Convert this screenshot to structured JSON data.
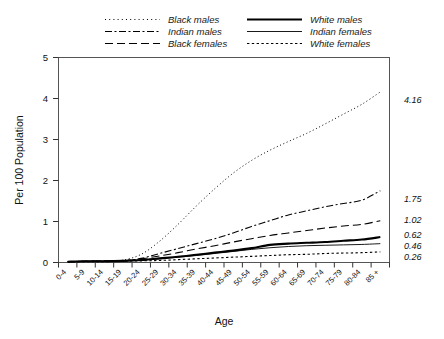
{
  "chart_data": {
    "type": "line",
    "title": "",
    "xlabel": "Age",
    "ylabel": "Per 100 Population",
    "ylim": [
      0,
      5
    ],
    "yticks": [
      "0",
      "1",
      "2",
      "3",
      "4",
      "5"
    ],
    "grid": false,
    "legend_position": "top",
    "categories": [
      "0-4",
      "5-9",
      "10-14",
      "15-19",
      "20-24",
      "25-29",
      "30-34",
      "35-39",
      "40-44",
      "45-49",
      "50-54",
      "55-59",
      "60-64",
      "65-69",
      "70-74",
      "75-79",
      "80-84",
      "85 +"
    ],
    "series": [
      {
        "name": "Black males",
        "style": "dotted",
        "end_value": "4.16",
        "values": [
          0.02,
          0.03,
          0.04,
          0.06,
          0.2,
          0.52,
          0.93,
          1.38,
          1.8,
          2.18,
          2.49,
          2.74,
          2.95,
          3.15,
          3.38,
          3.62,
          3.86,
          4.16
        ]
      },
      {
        "name": "Indian males",
        "style": "dash-dot",
        "end_value": "1.75",
        "values": [
          0.02,
          0.03,
          0.03,
          0.04,
          0.1,
          0.22,
          0.34,
          0.46,
          0.58,
          0.72,
          0.88,
          1.02,
          1.16,
          1.26,
          1.36,
          1.44,
          1.52,
          1.75
        ]
      },
      {
        "name": "Black females",
        "style": "long-dash",
        "end_value": "1.02",
        "values": [
          0.02,
          0.03,
          0.04,
          0.05,
          0.09,
          0.16,
          0.24,
          0.33,
          0.41,
          0.5,
          0.58,
          0.66,
          0.72,
          0.78,
          0.84,
          0.89,
          0.93,
          1.02
        ]
      },
      {
        "name": "White males",
        "style": "solid-thick",
        "end_value": "0.62",
        "values": [
          0.02,
          0.03,
          0.03,
          0.04,
          0.06,
          0.1,
          0.14,
          0.19,
          0.24,
          0.29,
          0.35,
          0.43,
          0.46,
          0.48,
          0.5,
          0.53,
          0.56,
          0.62
        ]
      },
      {
        "name": "Indian females",
        "style": "solid-thin",
        "end_value": "0.46",
        "values": [
          0.02,
          0.03,
          0.03,
          0.04,
          0.06,
          0.09,
          0.13,
          0.17,
          0.22,
          0.27,
          0.32,
          0.36,
          0.39,
          0.41,
          0.42,
          0.43,
          0.44,
          0.46
        ]
      },
      {
        "name": "White females",
        "style": "fine-dotted",
        "end_value": "0.26",
        "values": [
          0.01,
          0.02,
          0.02,
          0.03,
          0.04,
          0.05,
          0.07,
          0.09,
          0.11,
          0.13,
          0.15,
          0.17,
          0.19,
          0.2,
          0.22,
          0.23,
          0.24,
          0.26
        ]
      }
    ]
  },
  "legend": {
    "column_left": [
      {
        "label": "Black males",
        "key": "black-males"
      },
      {
        "label": "Indian males",
        "key": "indian-males"
      },
      {
        "label": "Black females",
        "key": "black-females"
      }
    ],
    "column_right": [
      {
        "label": "White males",
        "key": "white-males"
      },
      {
        "label": "Indian females",
        "key": "indian-females"
      },
      {
        "label": "White females",
        "key": "white-females"
      }
    ]
  },
  "axes": {
    "y_title": "Per 100 Population",
    "x_title": "Age",
    "y_tick_0": "0",
    "y_tick_1": "1",
    "y_tick_2": "2",
    "y_tick_3": "3",
    "y_tick_4": "4",
    "y_tick_5": "5"
  },
  "end_labels": {
    "black_males": "4.16",
    "indian_males": "1.75",
    "black_females": "1.02",
    "white_males": "0.62",
    "indian_females": "0.46",
    "white_females": "0.26"
  },
  "x_tick_labels": [
    "0-4",
    "5-9",
    "10-14",
    "15-19",
    "20-24",
    "25-29",
    "30-34",
    "35-39",
    "40-44",
    "45-49",
    "50-54",
    "55-59",
    "60-64",
    "65-69",
    "70-74",
    "75-79",
    "80-84",
    "85 +"
  ],
  "colors": {
    "line": "#000000",
    "frame": "#555555",
    "text": "#111111",
    "background": "#ffffff"
  }
}
